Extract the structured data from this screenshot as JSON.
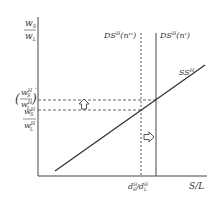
{
  "diagram": {
    "y_axis_label": {
      "num": "w",
      "num_sub": "S",
      "den": "w",
      "den_sub": "L"
    },
    "x_axis_label": "S/L",
    "upper_ratio_label": {
      "num": "w",
      "num_sup": "H",
      "num_sub": "S",
      "den": "w",
      "den_sup": "H",
      "den_sub": "L",
      "prime": "'"
    },
    "lower_ratio_label": {
      "num": "w",
      "num_sup": "H",
      "num_sub": "S",
      "den": "w",
      "den_sup": "H",
      "den_sub": "L"
    },
    "curves": {
      "ds_dotted": {
        "label": "DS",
        "sup": "H",
        "arg": "(n'')"
      },
      "ds_solid": {
        "label": "DS",
        "sup": "H",
        "arg": "(n')"
      },
      "ss": {
        "label": "SS",
        "sup": "H"
      }
    },
    "x_tick_label": {
      "a": "d",
      "a_sup": "H",
      "a_sub": "S",
      "sep": "/",
      "b": "d",
      "b_sup": "H",
      "b_sub": "L"
    },
    "arrows": [
      "up-arrow",
      "right-arrow"
    ],
    "colors": {
      "line": "#333333",
      "dashed": "#555555",
      "background": "#ffffff"
    }
  }
}
